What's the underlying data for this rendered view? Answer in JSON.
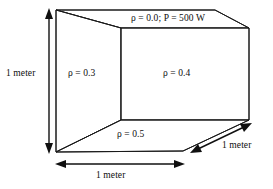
{
  "figure": {
    "faces": [
      {
        "id": "top",
        "label": "ρ = 0.0; P = 500 W"
      },
      {
        "id": "left",
        "label": "ρ = 0.3"
      },
      {
        "id": "right",
        "label": "ρ = 0.4"
      },
      {
        "id": "bottom",
        "label": "ρ = 0.5"
      }
    ],
    "dimensions": [
      {
        "id": "height",
        "label": "1 meter"
      },
      {
        "id": "width",
        "label": "1 meter"
      },
      {
        "id": "depth",
        "label": "1 meter"
      }
    ],
    "colors": {
      "stroke": "#1a1a1a",
      "fill": "#ffffff",
      "text": "#0d0d0d",
      "arrow": "#101010"
    }
  }
}
